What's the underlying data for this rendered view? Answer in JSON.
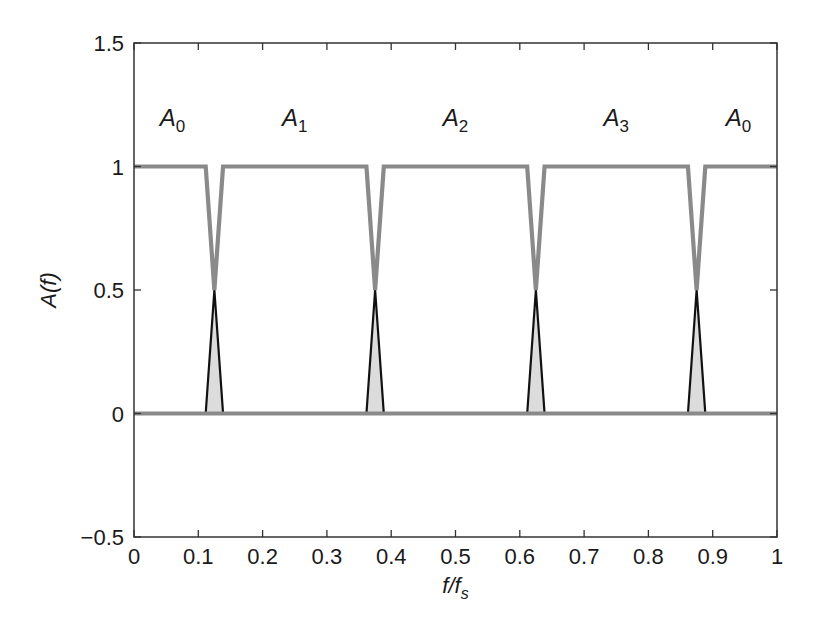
{
  "chart_data": {
    "type": "line",
    "title": "",
    "xlabel": "f/f_s",
    "xlabel_main": "f/f",
    "xlabel_sub": "S",
    "ylabel": "A(f)",
    "xlim": [
      0,
      1
    ],
    "ylim": [
      -0.5,
      1.5
    ],
    "xticks": [
      0,
      0.1,
      0.2,
      0.3,
      0.4,
      0.5,
      0.6,
      0.7,
      0.8,
      0.9,
      1
    ],
    "xtick_labels": [
      "0",
      "0.1",
      "0.2",
      "0.3",
      "0.4",
      "0.5",
      "0.6",
      "0.7",
      "0.8",
      "0.9",
      "1"
    ],
    "yticks": [
      -0.5,
      0,
      0.5,
      1,
      1.5
    ],
    "ytick_labels": [
      "−0.5",
      "0",
      "0.5",
      "1",
      "1.5"
    ],
    "grid": false,
    "legend": null,
    "notch_centers": [
      0.125,
      0.375,
      0.625,
      0.875
    ],
    "notch_halfwidth": 0.0135,
    "notch_depth_value": 0.5,
    "series": [
      {
        "name": "passband (gray, thick)",
        "color": "#8a8a8a",
        "x": [
          0,
          0.1115,
          0.125,
          0.1385,
          0.3615,
          0.375,
          0.3885,
          0.6115,
          0.625,
          0.6385,
          0.8615,
          0.875,
          0.8885,
          1
        ],
        "y": [
          1,
          1,
          0.5,
          1,
          1,
          0.5,
          1,
          1,
          0.5,
          1,
          1,
          0.5,
          1,
          1
        ]
      },
      {
        "name": "stopband baseline (gray, thick)",
        "color": "#8a8a8a",
        "x": [
          0,
          1
        ],
        "y": [
          0,
          0
        ]
      },
      {
        "name": "transition triangles (black outline, light fill)",
        "color": "#111111",
        "fill": "#dcdcdc",
        "triangles": [
          {
            "x": [
              0.1115,
              0.125,
              0.1385
            ],
            "y": [
              0,
              0.5,
              0
            ]
          },
          {
            "x": [
              0.3615,
              0.375,
              0.3885
            ],
            "y": [
              0,
              0.5,
              0
            ]
          },
          {
            "x": [
              0.6115,
              0.625,
              0.6385
            ],
            "y": [
              0,
              0.5,
              0
            ]
          },
          {
            "x": [
              0.8615,
              0.875,
              0.8885
            ],
            "y": [
              0,
              0.5,
              0
            ]
          }
        ]
      }
    ],
    "annotations": [
      {
        "text": "A0",
        "main": "A",
        "sub": "0",
        "x": 0.06,
        "y": 1.2
      },
      {
        "text": "A1",
        "main": "A",
        "sub": "1",
        "x": 0.25,
        "y": 1.2
      },
      {
        "text": "A2",
        "main": "A",
        "sub": "2",
        "x": 0.5,
        "y": 1.2
      },
      {
        "text": "A3",
        "main": "A",
        "sub": "3",
        "x": 0.75,
        "y": 1.2
      },
      {
        "text": "A0",
        "main": "A",
        "sub": "0",
        "x": 0.94,
        "y": 1.2
      }
    ]
  }
}
